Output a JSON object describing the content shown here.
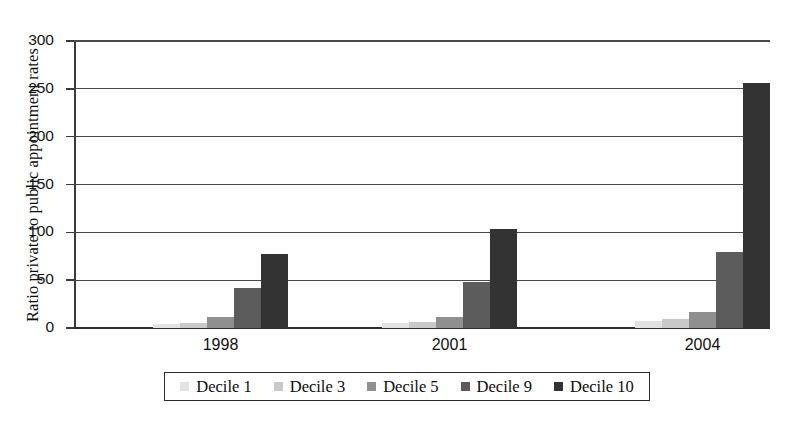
{
  "chart_data": {
    "type": "bar",
    "title": "",
    "xlabel": "",
    "ylabel": "Ratio private to public appointment rates",
    "categories": [
      "1998",
      "2001",
      "2004"
    ],
    "ylim": [
      0,
      300
    ],
    "yticks": [
      0,
      50,
      100,
      150,
      200,
      250,
      300
    ],
    "ytick_labels": [
      "0",
      "50",
      "100",
      "150",
      "200",
      "250",
      "300"
    ],
    "grid": true,
    "legend_position": "bottom",
    "series": [
      {
        "name": "Decile 1",
        "color": "#e2e2e2",
        "values": [
          4,
          5,
          7
        ]
      },
      {
        "name": "Decile 3",
        "color": "#c9c9c9",
        "values": [
          5,
          6,
          9
        ]
      },
      {
        "name": "Decile 5",
        "color": "#8f8f8f",
        "values": [
          12,
          12,
          17
        ]
      },
      {
        "name": "Decile 9",
        "color": "#5c5c5c",
        "values": [
          42,
          48,
          79
        ]
      },
      {
        "name": "Decile 10",
        "color": "#333333",
        "values": [
          77,
          104,
          256
        ]
      }
    ]
  },
  "axis": {
    "y_title": "Ratio private to public appointment rates"
  }
}
